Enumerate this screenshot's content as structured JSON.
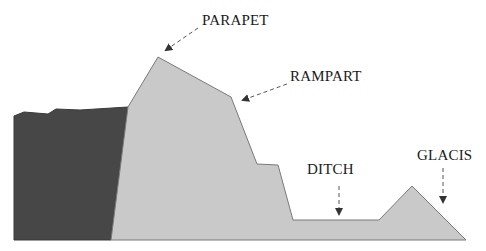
{
  "diagram": {
    "colors": {
      "background": "#ffffff",
      "earth_dark": "#474747",
      "earthwork_light": "#c9c9c9",
      "outline": "#7a7a7a",
      "arrow": "#555555",
      "label": "#1a1a1a"
    },
    "labels": [
      {
        "id": "parapet",
        "text": "PARAPET",
        "x": 202,
        "y": 13
      },
      {
        "id": "rampart",
        "text": "RAMPART",
        "x": 290,
        "y": 69
      },
      {
        "id": "ditch",
        "text": "DITCH",
        "x": 307,
        "y": 162
      },
      {
        "id": "glacis",
        "text": "GLACIS",
        "x": 417,
        "y": 148
      }
    ],
    "shapes": {
      "dark_earth": "14,116 24,112 48,114 56,109 80,110 128,107 111,240 14,240",
      "earthwork": "128,107 158,57 231,97 257,164 278,165 293,220 379,220 412,186 466,240 111,240"
    },
    "arrows": [
      {
        "id": "parapet-arrow",
        "x1": 198,
        "y1": 28,
        "x2": 166,
        "y2": 50
      },
      {
        "id": "rampart-arrow",
        "x1": 287,
        "y1": 84,
        "x2": 243,
        "y2": 100
      },
      {
        "id": "ditch-arrow",
        "x1": 339,
        "y1": 186,
        "x2": 339,
        "y2": 214
      },
      {
        "id": "glacis-arrow",
        "x1": 443,
        "y1": 168,
        "x2": 443,
        "y2": 202
      }
    ]
  }
}
